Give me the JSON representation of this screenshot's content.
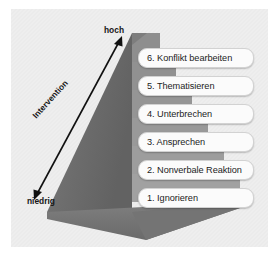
{
  "figure": {
    "background_color": "#eeeeee",
    "pyramid": {
      "left_face_color": "#6e6e6e",
      "right_face_color": "#8a8a8a",
      "base_color": "#7d7d7d",
      "step_count": 6
    },
    "axis": {
      "name": "Intervention",
      "arrow_label": "Intervention",
      "high_label": "hoch",
      "low_label": "niedrig",
      "arrow_color": "#111111",
      "direction": "bidirectional-diagonal"
    },
    "steps": [
      {
        "number": "6.",
        "label": "6. Konflikt bearbeiten",
        "level": 6
      },
      {
        "number": "5.",
        "label": "5. Thematisieren",
        "level": 5
      },
      {
        "number": "4.",
        "label": "4. Unterbrechen",
        "level": 4
      },
      {
        "number": "3.",
        "label": "3. Ansprechen",
        "level": 3
      },
      {
        "number": "2.",
        "label": "2. Nonverbale Reaktion",
        "level": 2
      },
      {
        "number": "1.",
        "label": "1. Ignorieren",
        "level": 1
      }
    ]
  }
}
